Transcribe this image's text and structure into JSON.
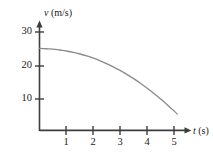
{
  "figure": {
    "background_color": "#ffffff",
    "axis_color": "#3d3d3d",
    "curve_color": "#8a8a8a"
  },
  "labels": {
    "y_axis_symbol": "v",
    "y_axis_unit": " (m/s)",
    "x_axis_symbol": "t",
    "x_axis_unit": " (s)"
  },
  "ticks": {
    "y": [
      "10",
      "20",
      "30"
    ],
    "x": [
      "1",
      "2",
      "3",
      "4",
      "5"
    ]
  },
  "chart_data": {
    "type": "line",
    "title": "",
    "subtitle": "",
    "xlabel": "t (s)",
    "ylabel": "v (m/s)",
    "xlim": [
      0,
      5.6
    ],
    "ylim": [
      0,
      33
    ],
    "grid": false,
    "legend": null,
    "x_ticks": [
      1,
      2,
      3,
      4,
      5
    ],
    "y_ticks": [
      10,
      20,
      30
    ],
    "annotations": [],
    "series": [
      {
        "name": "velocity",
        "color": "#8a8a8a",
        "x": [
          0.0,
          0.25,
          0.5,
          0.75,
          1.0,
          1.25,
          1.5,
          1.75,
          2.0,
          2.25,
          2.5,
          2.75,
          3.0,
          3.25,
          3.5,
          3.75,
          4.0,
          4.25,
          4.5,
          4.75,
          5.0,
          5.1
        ],
        "y": [
          25.0,
          24.9,
          24.8,
          24.5,
          24.2,
          23.8,
          23.3,
          22.7,
          22.0,
          21.2,
          20.3,
          19.3,
          18.2,
          17.0,
          15.7,
          14.3,
          12.8,
          11.2,
          9.5,
          7.7,
          5.8,
          5.0
        ]
      }
    ]
  }
}
